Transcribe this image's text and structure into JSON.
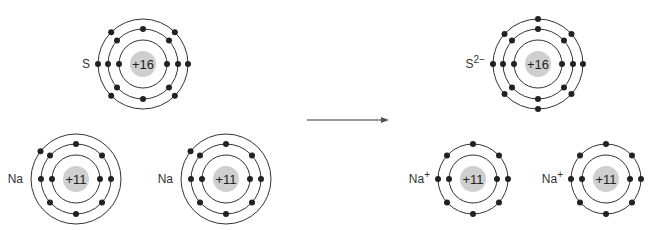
{
  "diagram": {
    "type": "ionic-bond-electron-transfer",
    "colors": {
      "nucleus": "#cfcfcf",
      "shell": "#333333",
      "electron": "#222222",
      "arrow": "#777777"
    },
    "reactants": [
      {
        "id": "s",
        "label": "S",
        "charge_label": "+16",
        "cx": 143,
        "cy": 64,
        "shells": [
          2,
          8,
          6
        ]
      },
      {
        "id": "na1",
        "label": "Na",
        "charge_label": "+11",
        "cx": 76,
        "cy": 179,
        "shells": [
          2,
          8,
          1
        ]
      },
      {
        "id": "na2",
        "label": "Na",
        "charge_label": "+11",
        "cx": 226,
        "cy": 179,
        "shells": [
          2,
          8,
          1
        ]
      }
    ],
    "products": [
      {
        "id": "s2",
        "label": "S",
        "superscript": "2−",
        "charge_label": "+16",
        "cx": 538,
        "cy": 64,
        "shells": [
          2,
          8,
          8
        ]
      },
      {
        "id": "na1p",
        "label": "Na",
        "superscript": "+",
        "charge_label": "+11",
        "cx": 473,
        "cy": 179,
        "shells": [
          2,
          8
        ]
      },
      {
        "id": "na2p",
        "label": "Na",
        "superscript": "+",
        "charge_label": "+11",
        "cx": 606,
        "cy": 179,
        "shells": [
          2,
          8
        ]
      }
    ],
    "arrow": {
      "x1": 307,
      "x2": 389,
      "y": 120
    }
  }
}
